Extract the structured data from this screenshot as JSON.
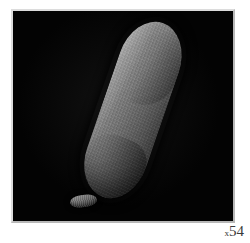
{
  "figure": {
    "type": "scanning-electron-micrograph",
    "alt_description": "Elongated rod-shaped specimen on a black background",
    "background_color": "#ffffff",
    "field_color": "#030303",
    "frame_color": "#c9c9c9",
    "specimen_color_light": "#a2a2a2",
    "specimen_color_dark": "#333333"
  },
  "caption": {
    "magnification_prefix": "x",
    "magnification_value": "54",
    "full_label": "x54"
  },
  "specimen": {
    "name": "rod-shaped-specimen",
    "fragment_name": "detached-fragment",
    "orientation_degrees": "19",
    "surface_texture": "longitudinal-striations"
  }
}
